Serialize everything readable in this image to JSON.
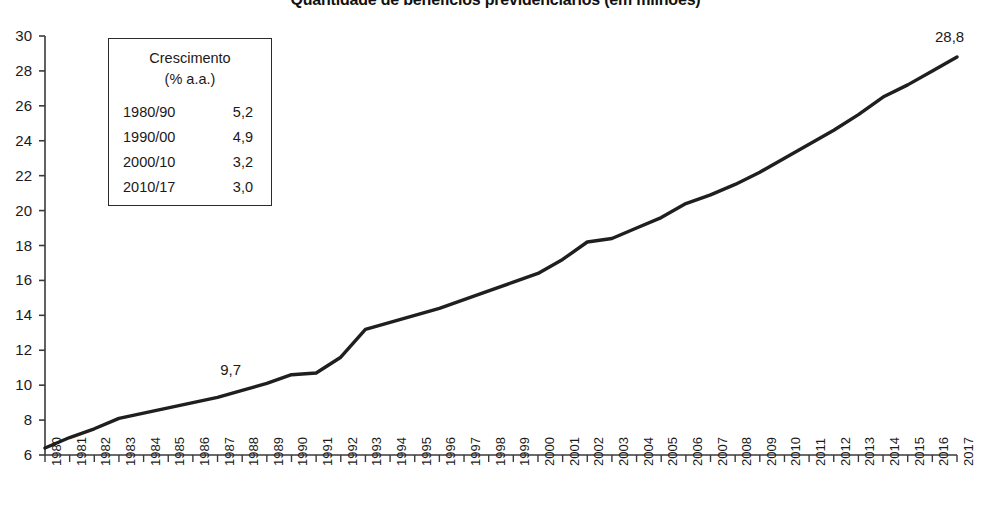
{
  "chart_data": {
    "type": "line",
    "title": "Quantidade de benefícios previdenciários (em milhões)",
    "xlabel": "",
    "ylabel": "",
    "ylim": [
      6,
      30
    ],
    "ytick_step": 2,
    "grid": false,
    "legend_position": "none",
    "x": [
      1980,
      1981,
      1982,
      1983,
      1984,
      1985,
      1986,
      1987,
      1988,
      1989,
      1990,
      1991,
      1992,
      1993,
      1994,
      1995,
      1996,
      1997,
      1998,
      1999,
      2000,
      2001,
      2002,
      2003,
      2004,
      2005,
      2006,
      2007,
      2008,
      2009,
      2010,
      2011,
      2012,
      2013,
      2014,
      2015,
      2016,
      2017
    ],
    "xticklabels": [
      "1980",
      "1981",
      "1982",
      "1983",
      "1984",
      "1985",
      "1986",
      "1987",
      "1988",
      "1989",
      "1990",
      "1991",
      "1992",
      "1993",
      "1994",
      "1995",
      "1996",
      "1997",
      "1998",
      "1999",
      "2000",
      "2001",
      "2002",
      "2003",
      "2004",
      "2005",
      "2006",
      "2007",
      "2008",
      "2009",
      "2010",
      "2011",
      "2012",
      "2013",
      "2014",
      "2015",
      "2016",
      "2017"
    ],
    "yticklabels": [
      "6",
      "8",
      "10",
      "12",
      "14",
      "16",
      "18",
      "20",
      "22",
      "24",
      "26",
      "28",
      "30"
    ],
    "series": [
      {
        "name": "Benefícios previdenciários",
        "color": "#1f1f1f",
        "values": [
          6.4,
          7.0,
          7.5,
          8.1,
          8.4,
          8.7,
          9.0,
          9.3,
          9.7,
          10.1,
          10.6,
          10.7,
          11.6,
          13.2,
          13.6,
          14.0,
          14.4,
          14.9,
          15.4,
          15.9,
          16.4,
          17.2,
          18.2,
          18.4,
          19.0,
          19.6,
          20.4,
          20.9,
          21.5,
          22.2,
          23.0,
          23.8,
          24.6,
          25.5,
          26.5,
          27.2,
          28.0,
          28.8
        ]
      }
    ],
    "annotations": [
      {
        "label": "9,7",
        "x": 1988,
        "y": 9.7
      },
      {
        "label": "28,8",
        "x": 2017,
        "y": 28.8
      }
    ]
  },
  "growth_box": {
    "heading_line1": "Crescimento",
    "heading_line2": "(% a.a.)",
    "rows": [
      {
        "period": "1980/90",
        "rate": "5,2"
      },
      {
        "period": "1990/00",
        "rate": "4,9"
      },
      {
        "period": "2000/10",
        "rate": "3,2"
      },
      {
        "period": "2010/17",
        "rate": "3,0"
      }
    ]
  },
  "colors": {
    "line": "#1f1f1f",
    "axis": "#3a3a3a",
    "text": "#1a1a1a",
    "background": "#ffffff"
  }
}
